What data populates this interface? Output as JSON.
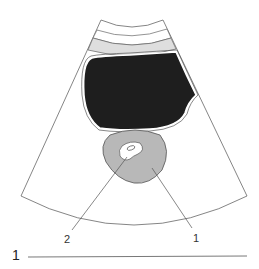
{
  "figure": {
    "number": "1",
    "labels": [
      {
        "id": "1",
        "text": "1"
      },
      {
        "id": "2",
        "text": "2"
      }
    ]
  },
  "colors": {
    "outline": "#555555",
    "band_fill": "#dedede",
    "dark_region": "#1e1e1e",
    "organ_fill": "#b8b8b8",
    "lumen_fill": "#ffffff"
  }
}
